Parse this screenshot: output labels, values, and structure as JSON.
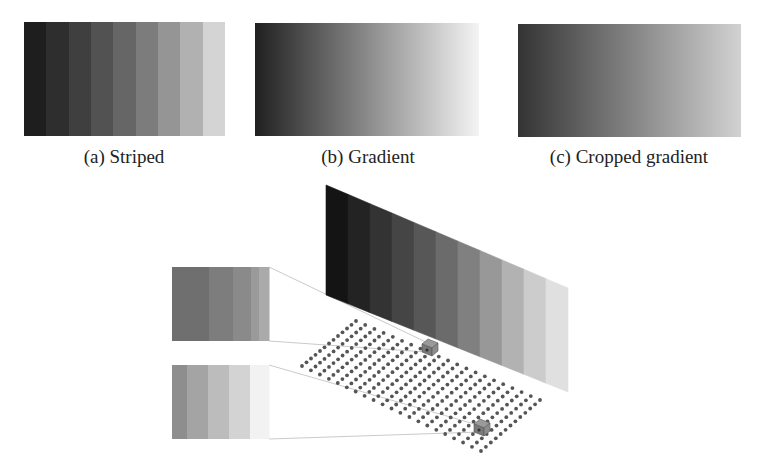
{
  "figure": {
    "subfigures": [
      {
        "id": "a",
        "caption": "(a) Striped",
        "type": "striped",
        "box": {
          "x": 24,
          "y": 22,
          "w": 201,
          "h": 114
        },
        "stripes": [
          "#1e1e1e",
          "#2e2e2e",
          "#3f3f3f",
          "#525252",
          "#666666",
          "#7c7c7c",
          "#959595",
          "#b1b1b1",
          "#d4d4d4"
        ],
        "caption_center_x": 124,
        "caption_y": 146
      },
      {
        "id": "b",
        "caption": "(b) Gradient",
        "type": "gradient",
        "box": {
          "x": 255,
          "y": 23,
          "w": 224,
          "h": 113
        },
        "gradient": {
          "from": "#202020",
          "to": "#f4f4f4"
        },
        "caption_center_x": 368,
        "caption_y": 146
      },
      {
        "id": "c",
        "caption": "(c) Cropped gradient",
        "type": "gradient",
        "box": {
          "x": 518,
          "y": 24,
          "w": 223,
          "h": 113
        },
        "gradient": {
          "from": "#333333",
          "to": "#d2d2d2"
        },
        "caption_center_x": 629,
        "caption_y": 146
      }
    ],
    "illustration": {
      "wall": {
        "corners": {
          "tl": [
            326,
            185
          ],
          "tr": [
            568,
            288
          ],
          "br": [
            568,
            392
          ],
          "bl": [
            326,
            295
          ]
        },
        "stripes": [
          "#141414",
          "#232323",
          "#333333",
          "#454545",
          "#575757",
          "#6b6b6b",
          "#808080",
          "#989898",
          "#b2b2b2",
          "#cccccc",
          "#e0e0e0"
        ]
      },
      "dot_grid": {
        "corners": {
          "top": [
            356,
            321
          ],
          "right": [
            540,
            400
          ],
          "bottom": [
            481,
            451
          ],
          "left": [
            302,
            366
          ]
        },
        "rows": 13,
        "cols": 21,
        "dot_color": "#555555",
        "dot_radius": 1.9
      },
      "cameras": [
        {
          "id": "camera-near-wall",
          "center": [
            430,
            348
          ]
        },
        {
          "id": "camera-far",
          "center": [
            482,
            428
          ]
        }
      ],
      "insets": [
        {
          "id": "inset-top",
          "box": {
            "x": 172,
            "y": 267,
            "w": 97,
            "h": 74
          },
          "stripes": [
            "#6f6f6f",
            "#7d7d7d",
            "#8a8a8a",
            "#9a9a9a",
            "#aaaaaa"
          ],
          "stripe_widths": [
            37,
            24,
            18,
            8,
            10
          ],
          "leader_lines": [
            [
              [
                269,
                267
              ],
              [
                430,
                344
              ]
            ],
            [
              [
                269,
                341
              ],
              [
                426,
                352
              ]
            ]
          ]
        },
        {
          "id": "inset-bottom",
          "box": {
            "x": 172,
            "y": 365,
            "w": 97,
            "h": 74
          },
          "stripes": [
            "#8e8e8e",
            "#a4a4a4",
            "#bcbcbc",
            "#d3d3d3",
            "#f2f2f2"
          ],
          "stripe_widths": [
            15,
            21,
            21,
            21,
            19
          ],
          "leader_lines": [
            [
              [
                269,
                365
              ],
              [
                478,
                425
              ]
            ],
            [
              [
                269,
                439
              ],
              [
                480,
                432
              ]
            ]
          ]
        }
      ],
      "line_color": "#bdbdbd"
    }
  }
}
